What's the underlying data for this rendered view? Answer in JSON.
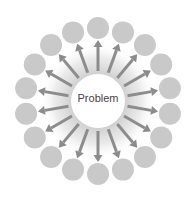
{
  "diagram": {
    "center_label": "Problem",
    "node_count": 18,
    "center": [
      98,
      101
    ],
    "ring_radius": 73,
    "node_radius": 11,
    "core_radius": 27,
    "colors": {
      "node": "#c9c9c9",
      "arrow": "#8c8c8c",
      "core": "#ffffff",
      "glow": "#d8d8d8"
    }
  }
}
